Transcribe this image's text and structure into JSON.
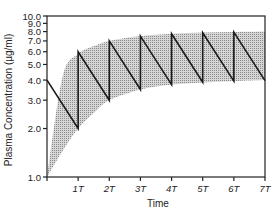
{
  "chart_data": {
    "type": "line",
    "title": "",
    "xlabel": "Time",
    "ylabel": "Plasma Concentration (µg/ml)",
    "yscale": "log",
    "ylim": [
      1.0,
      10.0
    ],
    "xlim": [
      0,
      7
    ],
    "y_ticks": [
      "1.0",
      "2.0",
      "3.0",
      "4.0",
      "5.0",
      "6.0",
      "7.0",
      "8.0",
      "9.0",
      "10.0"
    ],
    "y_tick_values": [
      1,
      2,
      3,
      4,
      5,
      6,
      7,
      8,
      9,
      10
    ],
    "x_ticks": [
      "1T",
      "2T",
      "3T",
      "4T",
      "5T",
      "6T",
      "7T"
    ],
    "x_tick_values": [
      1,
      2,
      3,
      4,
      5,
      6,
      7
    ],
    "grid": false,
    "series": [
      {
        "name": "Repeated-dose concentration (sawtooth)",
        "x": [
          0,
          1,
          1,
          2,
          2,
          3,
          3,
          4,
          4,
          5,
          5,
          6,
          6,
          7
        ],
        "y": [
          4.0,
          2.0,
          6.0,
          3.0,
          7.0,
          3.5,
          7.5,
          3.75,
          7.75,
          3.875,
          7.875,
          3.94,
          7.94,
          3.97
        ]
      },
      {
        "name": "Shaded band upper bound (peak envelope)",
        "x": [
          0,
          0.5,
          1,
          1.5,
          2,
          3,
          4,
          5,
          6,
          7
        ],
        "y": [
          1.0,
          4.2,
          5.8,
          6.5,
          7.0,
          7.5,
          7.75,
          7.9,
          7.95,
          8.0
        ]
      },
      {
        "name": "Shaded band lower bound (trough envelope)",
        "x": [
          0,
          0.5,
          1,
          1.5,
          2,
          3,
          4,
          5,
          6,
          7
        ],
        "y": [
          1.0,
          1.45,
          2.0,
          2.5,
          3.0,
          3.5,
          3.75,
          3.87,
          3.94,
          4.0
        ]
      }
    ],
    "colors": {
      "line": "#1a1a1a",
      "band_fill": "#b8b8b8",
      "axis": "#222222"
    }
  }
}
